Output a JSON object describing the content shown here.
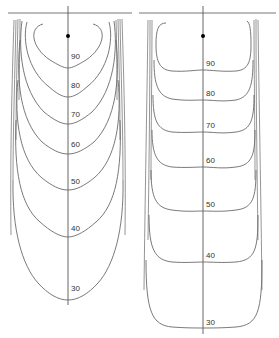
{
  "figure": {
    "panels": [
      {
        "id": "left",
        "description": "Isodose-style contour plot, rounded (V-shaped) profile",
        "labels": [
          "90",
          "80",
          "70",
          "60",
          "50",
          "40",
          "30"
        ]
      },
      {
        "id": "right",
        "description": "Isodose-style contour plot, flattened (box-shaped) profile",
        "labels": [
          "90",
          "80",
          "70",
          "60",
          "50",
          "40",
          "30"
        ]
      }
    ]
  },
  "colors": {
    "line": "#6a6a6a",
    "background": "#ffffff",
    "marker": "#000000"
  }
}
